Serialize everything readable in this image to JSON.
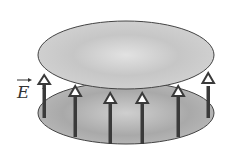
{
  "diagram": {
    "field_label": "E",
    "field_label_has_vector_arrow": true,
    "plates": [
      {
        "name": "top-plate",
        "shape": "ellipse",
        "color": "#c8c8c8"
      },
      {
        "name": "bottom-plate",
        "shape": "ellipse",
        "color": "#b4b4b4"
      }
    ],
    "field_arrows": {
      "count": 6,
      "direction": "up",
      "color": "#3a3a3a"
    }
  }
}
